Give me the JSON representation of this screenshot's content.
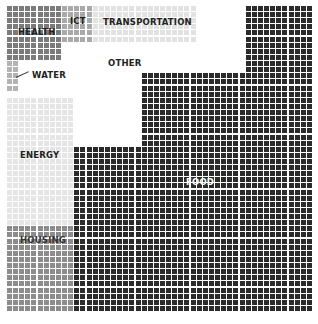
{
  "chart_data": {
    "type": "waffle",
    "title": "",
    "grid": {
      "cols": 50,
      "rows": 50,
      "total_cells": 2500
    },
    "legend": "inline labels",
    "categories": [
      "FOOD",
      "OTHER",
      "ENERGY",
      "HOUSING",
      "TRANSPORTATION",
      "HEALTH",
      "ICT",
      "WATER"
    ],
    "series": [
      {
        "name": "FOOD",
        "color": "#2b2b2b",
        "label_color": "#ffffff",
        "cells": 1510,
        "rects": [
          {
            "c0": 39,
            "c1": 49,
            "r0": 0,
            "r1": 10
          },
          {
            "c0": 22,
            "c1": 49,
            "r0": 11,
            "r1": 22
          },
          {
            "c0": 11,
            "c1": 49,
            "r0": 23,
            "r1": 49
          }
        ],
        "label_pos": {
          "x": 186,
          "y": 178
        }
      },
      {
        "name": "OTHER",
        "color": "#ffffff",
        "label_color": "#222222",
        "cells": 408,
        "rects": [],
        "label_pos": {
          "x": 108,
          "y": 59
        }
      },
      {
        "name": "ENERGY",
        "color": "#e5e5e5",
        "label_color": "#222222",
        "cells": 231,
        "rects": [
          {
            "c0": 0,
            "c1": 10,
            "r0": 15,
            "r1": 35
          }
        ],
        "label_pos": {
          "x": 20,
          "y": 151
        }
      },
      {
        "name": "HOUSING",
        "color": "#8c8c8c",
        "label_color": "#333333",
        "cells": 154,
        "rects": [
          {
            "c0": 0,
            "c1": 10,
            "r0": 36,
            "r1": 49
          }
        ],
        "label_pos": {
          "x": 20,
          "y": 236
        }
      },
      {
        "name": "TRANSPORTATION",
        "color": "#e2e2e2",
        "label_color": "#222222",
        "cells": 102,
        "rects": [
          {
            "c0": 14,
            "c1": 30,
            "r0": 0,
            "r1": 5
          }
        ],
        "label_pos": {
          "x": 103,
          "y": 18
        }
      },
      {
        "name": "HEALTH",
        "color": "#7b7b7b",
        "label_color": "#222222",
        "cells": 81,
        "rects": [
          {
            "c0": 0,
            "c1": 8,
            "r0": 0,
            "r1": 8
          }
        ],
        "label_pos": {
          "x": 18,
          "y": 28
        }
      },
      {
        "name": "ICT",
        "color": "#a9a9a9",
        "label_color": "#222222",
        "cells": 30,
        "rects": [
          {
            "c0": 9,
            "c1": 13,
            "r0": 0,
            "r1": 5
          }
        ],
        "label_pos": {
          "x": 70,
          "y": 17
        }
      },
      {
        "name": "WATER",
        "color": "#b3b3b3",
        "label_color": "#222222",
        "cells": 10,
        "rects": [
          {
            "c0": 0,
            "c1": 1,
            "r0": 9,
            "r1": 13
          }
        ],
        "label_pos": {
          "x": 32,
          "y": 71
        }
      }
    ],
    "values": [
      1510,
      408,
      231,
      154,
      102,
      81,
      30,
      10
    ]
  }
}
